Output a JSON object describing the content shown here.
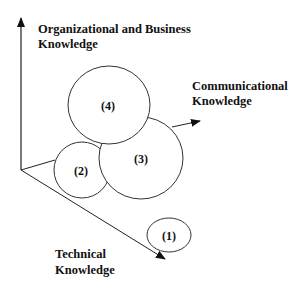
{
  "diagram": {
    "axes": {
      "vertical": {
        "line1": "Organizational and Business",
        "line2": "Knowledge"
      },
      "right": {
        "line1": "Communicational",
        "line2": "Knowledge"
      },
      "diagonal": {
        "line1": "Technical",
        "line2": "Knowledge"
      }
    },
    "circles": [
      {
        "label": "(1)"
      },
      {
        "label": "(2)"
      },
      {
        "label": "(3)"
      },
      {
        "label": "(4)"
      }
    ],
    "colors": {
      "stroke": "#222222",
      "background": "#ffffff"
    }
  }
}
